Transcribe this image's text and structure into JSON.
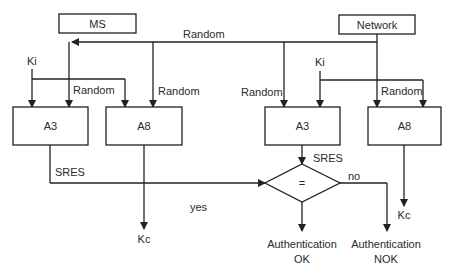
{
  "diagram": {
    "type": "flowchart",
    "topic": "GSM authentication (A3/A8)",
    "nodes": {
      "ms": {
        "label": "MS"
      },
      "network": {
        "label": "Network"
      },
      "ms_a3": {
        "label": "A3"
      },
      "ms_a8": {
        "label": "A8"
      },
      "net_a3": {
        "label": "A3"
      },
      "net_a8": {
        "label": "A8"
      },
      "compare": {
        "label": "="
      },
      "auth_ok": {
        "line1": "Authentication",
        "line2": "OK"
      },
      "auth_nok": {
        "line1": "Authentication",
        "line2": "NOK"
      },
      "ms_kc": {
        "label": "Kc"
      },
      "net_kc": {
        "label": "Kc"
      }
    },
    "labels": {
      "random_top": "Random",
      "random_ms_a3": "Random",
      "random_ms_a8": "Random",
      "random_net_a3": "Random",
      "random_net_a8": "Random",
      "ki_ms": "Ki",
      "ki_net": "Ki",
      "sres_ms": "SRES",
      "sres_net": "SRES",
      "yes": "yes",
      "no": "no"
    },
    "edges": [
      {
        "from": "network",
        "to": "ms",
        "label": "Random"
      },
      {
        "from": "ki_ms",
        "to": "ms_a3"
      },
      {
        "from": "ki_ms",
        "to": "ms_a8"
      },
      {
        "from": "random",
        "to": "ms_a3",
        "label": "Random"
      },
      {
        "from": "random",
        "to": "ms_a8",
        "label": "Random"
      },
      {
        "from": "random",
        "to": "net_a3",
        "label": "Random"
      },
      {
        "from": "random",
        "to": "net_a8",
        "label": "Random"
      },
      {
        "from": "ki_net",
        "to": "net_a3"
      },
      {
        "from": "ki_net",
        "to": "net_a8"
      },
      {
        "from": "ms_a3",
        "to": "compare",
        "label": "SRES"
      },
      {
        "from": "net_a3",
        "to": "compare",
        "label": "SRES"
      },
      {
        "from": "ms_a8",
        "to": "ms_kc"
      },
      {
        "from": "net_a8",
        "to": "net_kc"
      },
      {
        "from": "compare",
        "to": "auth_ok",
        "label": "yes"
      },
      {
        "from": "compare",
        "to": "auth_nok",
        "label": "no"
      }
    ]
  }
}
